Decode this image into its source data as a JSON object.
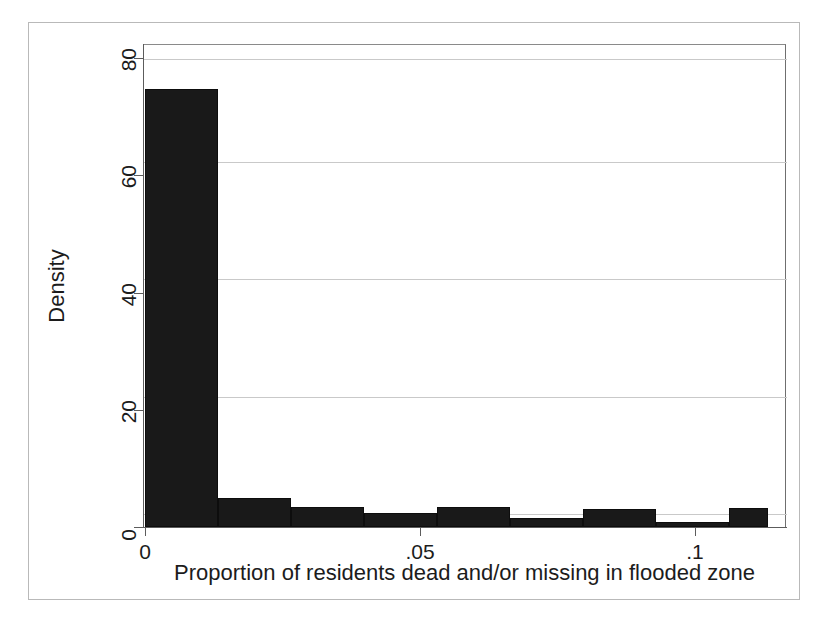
{
  "figure": {
    "kind": "histogram",
    "background_color": "#ffffff",
    "bar_color": "#191919",
    "axis_color": "#5c5c5c",
    "grid_color": "#c9c9c9",
    "frame_color": "#b9b9b9"
  },
  "axes": {
    "x_title": "Proportion of residents dead and/or missing in flooded zone",
    "y_title": "Density",
    "x_ticks": [
      "0",
      ".05",
      ".1"
    ],
    "y_ticks": [
      "0",
      "20",
      "40",
      "60",
      "80"
    ]
  },
  "chart_data": {
    "type": "bar",
    "title": "",
    "xlabel": "Proportion of residents dead and/or missing in flooded zone",
    "ylabel": "Density",
    "xlim": [
      -0.0035,
      0.1132
    ],
    "ylim": [
      0,
      82.4
    ],
    "xtick_values": [
      0,
      0.05,
      0.1
    ],
    "xtick_labels": [
      "0",
      ".05",
      ".1"
    ],
    "ytick_values": [
      0,
      20,
      40,
      60,
      80
    ],
    "ytick_labels": [
      "0",
      "20",
      "40",
      "60",
      "80"
    ],
    "grid": "horizontal",
    "legend": "none",
    "bin_width": 0.01327,
    "bin_edges": [
      0.0,
      0.01327,
      0.02655,
      0.03982,
      0.05309,
      0.06636,
      0.07964,
      0.09291,
      0.10618,
      0.11327
    ],
    "categories": [
      "0–.0133",
      ".0133–.0265",
      ".0265–.0398",
      ".0398–.0531",
      ".0531–.0664",
      ".0664–.0796",
      ".0796–.0929",
      ".0929–.1062",
      ".1062–.1133"
    ],
    "values": [
      74.7,
      5.0,
      3.4,
      2.4,
      3.4,
      1.5,
      3.1,
      0.9,
      3.2
    ],
    "bars": [
      {
        "x0": 0.0,
        "x1": 0.01327,
        "density": 74.7
      },
      {
        "x0": 0.01327,
        "x1": 0.02655,
        "density": 5.0
      },
      {
        "x0": 0.02655,
        "x1": 0.03982,
        "density": 3.4
      },
      {
        "x0": 0.03982,
        "x1": 0.05309,
        "density": 2.4
      },
      {
        "x0": 0.05309,
        "x1": 0.06636,
        "density": 3.4
      },
      {
        "x0": 0.06636,
        "x1": 0.07964,
        "density": 1.5
      },
      {
        "x0": 0.07964,
        "x1": 0.09291,
        "density": 3.1
      },
      {
        "x0": 0.09291,
        "x1": 0.10618,
        "density": 0.9
      },
      {
        "x0": 0.10618,
        "x1": 0.11327,
        "density": 3.2
      }
    ]
  }
}
